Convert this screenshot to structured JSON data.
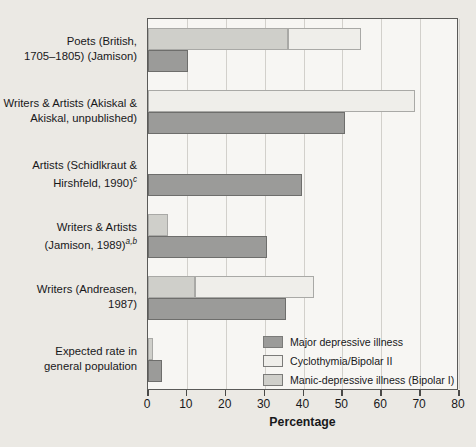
{
  "chart_data": {
    "type": "bar",
    "orientation": "horizontal",
    "title": "",
    "xlabel": "Percentage",
    "ylabel": "",
    "xlim": [
      0,
      80
    ],
    "xticks": [
      0,
      10,
      20,
      30,
      40,
      50,
      60,
      70,
      80
    ],
    "grid": true,
    "legend_position": "inside-bottom-right",
    "categories": [
      "Poets (British, 1705–1805) (Jamison)",
      "Writers & Artists (Akiskal & Akiskal, unpublished)",
      "Artists (Schidlkraut & Hirshfeld, 1990)c",
      "Writers & Artists (Jamison, 1989)a,b",
      "Writers (Andreasen, 1987)",
      "Expected rate in general population"
    ],
    "series": [
      {
        "name": "Major depressive illness",
        "color": "#9b9b99",
        "values": [
          10.3,
          50.8,
          39.5,
          30.7,
          35.6,
          3.6
        ]
      },
      {
        "name": "Cyclothymia/Bipolar II",
        "color": "#efeeea",
        "values": [
          18.7,
          68.6,
          0,
          0,
          30.6,
          0
        ]
      },
      {
        "name": "Manic-depressive illness (Bipolar I)",
        "color": "#cfcfca",
        "values": [
          36.0,
          0,
          0,
          5.2,
          12.0,
          1.3
        ]
      }
    ]
  },
  "axis": {
    "x_title": "Percentage",
    "tick_labels": [
      "0",
      "10",
      "20",
      "30",
      "40",
      "50",
      "60",
      "70",
      "80"
    ]
  },
  "categories": [
    {
      "id": "poets-british",
      "line1": "Poets (British,",
      "line2": "1705–1805) (Jamison)",
      "sup": ""
    },
    {
      "id": "writers-artists-akiskal",
      "line1": "Writers & Artists (Akiskal &",
      "line2": "Akiskal, unpublished)",
      "sup": ""
    },
    {
      "id": "artists-schidlkraut",
      "line1": "Artists (Schidlkraut &",
      "line2": "Hirshfeld, 1990)",
      "sup": "c"
    },
    {
      "id": "writers-artists-jamison",
      "line1": "Writers & Artists",
      "line2": "(Jamison, 1989)",
      "sup": "a,b"
    },
    {
      "id": "writers-andreasen",
      "line1": "Writers (Andreasen,",
      "line2": "1987)",
      "sup": ""
    },
    {
      "id": "expected-rate",
      "line1": "Expected rate in",
      "line2": "general population",
      "sup": ""
    }
  ],
  "legend": {
    "items": [
      {
        "label": "Major depressive illness",
        "color": "#9b9b99"
      },
      {
        "label": "Cyclothymia/Bipolar II",
        "color": "#efeeea"
      },
      {
        "label": "Manic-depressive illness (Bipolar I)",
        "color": "#cfcfca"
      }
    ]
  },
  "colors": {
    "page_background": "#ebe9e4",
    "plot_background": "#f7f6f3",
    "gridline": "#d2d0cb",
    "frame": "#5a5a58",
    "text": "#18181a",
    "major_depressive": "#9b9b99",
    "cyclothymia": "#efeeea",
    "manic_depressive": "#cfcfca"
  }
}
